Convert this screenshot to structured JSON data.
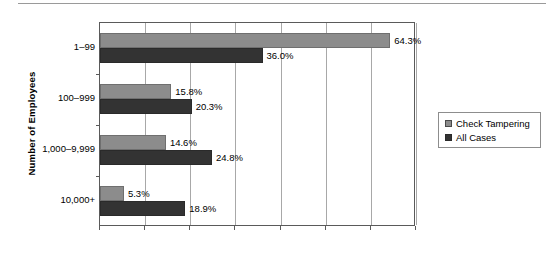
{
  "chart_data": {
    "type": "bar",
    "orientation": "horizontal",
    "title": "",
    "xlabel": "",
    "ylabel": "Number of Employees",
    "categories": [
      "1–99",
      "100–999",
      "1,000–9,999",
      "10,000+"
    ],
    "series": [
      {
        "name": "Check Tampering",
        "color": "#8c8c8c",
        "values": [
          64.3,
          15.8,
          14.6,
          5.3
        ],
        "labels": [
          "64.3%",
          "15.8%",
          "14.6%",
          "5.3%"
        ]
      },
      {
        "name": "All Cases",
        "color": "#333333",
        "values": [
          36.0,
          20.3,
          24.8,
          18.9
        ],
        "labels": [
          "36.0%",
          "20.3%",
          "24.8%",
          "18.9%"
        ]
      }
    ],
    "xlim": [
      0,
      70
    ],
    "xticks": [
      0,
      10,
      20,
      30,
      40,
      50,
      60,
      70
    ],
    "xticklabels": [
      "",
      "",
      "",
      "",
      "",
      "",
      "",
      ""
    ],
    "grid": true,
    "legend_position": "right"
  },
  "axis": {
    "y_title": "Number of Employees",
    "category_labels": [
      "1–99",
      "100–999",
      "1,000–9,999",
      "10,000+"
    ]
  },
  "legend": {
    "entries": [
      {
        "label": "Check Tampering",
        "color": "#8c8c8c"
      },
      {
        "label": "All Cases",
        "color": "#333333"
      }
    ]
  }
}
